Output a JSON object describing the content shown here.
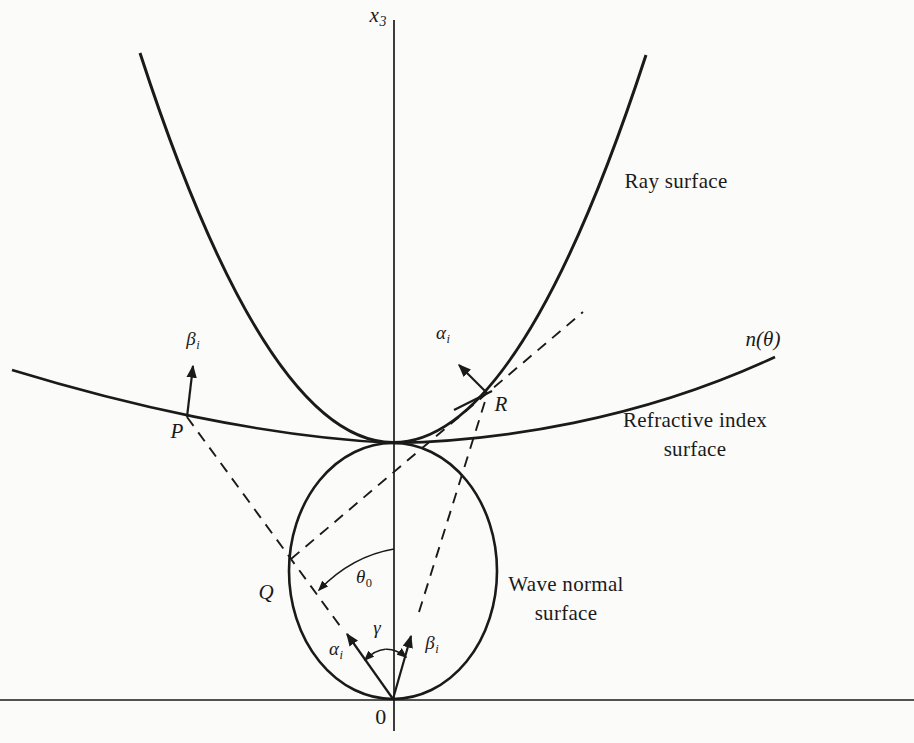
{
  "figure": {
    "colors": {
      "paper": "#fbfbf9",
      "ink": "#1a1a1a"
    },
    "axes": {
      "x3_base": "x",
      "x3_sub": "3",
      "origin": "0"
    },
    "surfaces": {
      "ray": "Ray surface",
      "n_theta": "n(θ)",
      "refractive_line1": "Refractive index",
      "refractive_line2": "surface",
      "wave_line1": "Wave normal",
      "wave_line2": "surface"
    },
    "points": {
      "P": "P",
      "Q": "Q",
      "R": "R"
    },
    "symbols": {
      "alpha_base": "α",
      "alpha_sub": "i",
      "beta_base": "β",
      "beta_sub": "i",
      "gamma": "γ",
      "theta_base": "θ",
      "theta_sub": "0"
    }
  }
}
